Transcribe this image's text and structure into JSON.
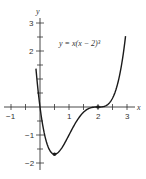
{
  "chart_data": {
    "type": "line",
    "title": "",
    "equation": "y = x(x − 2)³",
    "xlabel": "x",
    "ylabel": "y",
    "xlim": [
      -1.2,
      3.3
    ],
    "ylim": [
      -2.2,
      3.2
    ],
    "x_ticks": [
      -1,
      -0.5,
      0,
      0.5,
      1,
      1.5,
      2,
      2.5,
      3
    ],
    "x_tick_labels": [
      {
        "value": -1,
        "label": "−1"
      },
      {
        "value": 1,
        "label": "1"
      },
      {
        "value": 2,
        "label": "2"
      },
      {
        "value": 3,
        "label": "3"
      }
    ],
    "y_ticks": [
      -2,
      -1.5,
      -1,
      -0.5,
      0.5,
      1,
      1.5,
      2,
      2.5,
      3
    ],
    "y_tick_labels": [
      {
        "value": 3,
        "label": "3"
      },
      {
        "value": 2,
        "label": "2"
      },
      {
        "value": -1,
        "label": "−1"
      },
      {
        "value": -2,
        "label": "−2"
      }
    ],
    "grid": false,
    "series": [
      {
        "name": "y = x(x − 2)³",
        "x_range": [
          -0.14,
          2.95
        ],
        "points": [
          [
            -0.14,
            1.37
          ],
          [
            0,
            0
          ],
          [
            0.25,
            -1.33
          ],
          [
            0.5,
            -1.6875
          ],
          [
            0.75,
            -1.46
          ],
          [
            1,
            -1
          ],
          [
            1.25,
            -0.53
          ],
          [
            1.5,
            -0.19
          ],
          [
            1.75,
            -0.03
          ],
          [
            2,
            0
          ],
          [
            2.25,
            0.04
          ],
          [
            2.5,
            0.31
          ],
          [
            2.75,
            1.16
          ],
          [
            2.95,
            2.53
          ]
        ]
      }
    ],
    "marked_points": [
      {
        "x": 0.5,
        "y": -1.6875,
        "note": "local minimum"
      },
      {
        "x": 2,
        "y": 0,
        "note": "inflection point"
      }
    ]
  },
  "labels": {
    "x_axis": "x",
    "y_axis": "y",
    "equation": "y = x(x − 2)³",
    "xt_m1": "−1",
    "xt_1": "1",
    "xt_2": "2",
    "xt_3": "3",
    "yt_3": "3",
    "yt_2": "2",
    "yt_m1": "−1",
    "yt_m2": "−2"
  },
  "colors": {
    "curve": "#1a1a1a",
    "axis": "#333333"
  }
}
